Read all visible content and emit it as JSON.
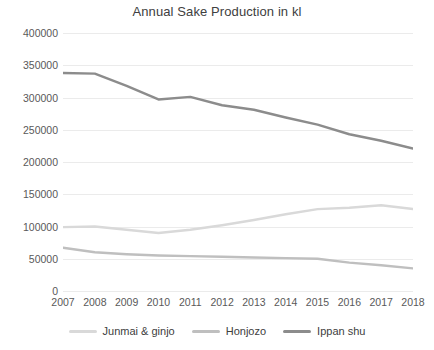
{
  "chart_data": {
    "type": "line",
    "title": "Annual Sake Production in kl",
    "xlabel": "",
    "ylabel": "",
    "categories": [
      "2007",
      "2008",
      "2009",
      "2010",
      "2011",
      "2012",
      "2013",
      "2014",
      "2015",
      "2016",
      "2017",
      "2018"
    ],
    "ylim": [
      0,
      400000
    ],
    "ytick_values": [
      0,
      50000,
      100000,
      150000,
      200000,
      250000,
      300000,
      350000,
      400000
    ],
    "ytick_labels": [
      "0",
      "50000",
      "100000",
      "150000",
      "200000",
      "250000",
      "300000",
      "350000",
      "400000"
    ],
    "grid": true,
    "legend_position": "bottom",
    "series": [
      {
        "name": "Junmai & ginjo",
        "color": "#d9d9d9",
        "values": [
          99000,
          100000,
          95000,
          90000,
          95000,
          102000,
          110000,
          119000,
          127000,
          129000,
          133000,
          127000
        ]
      },
      {
        "name": "Honjozo",
        "color": "#bfbfbf",
        "values": [
          67000,
          60000,
          57000,
          55000,
          54000,
          53000,
          52000,
          51000,
          50000,
          44000,
          40000,
          35000
        ]
      },
      {
        "name": "Ippan shu",
        "color": "#8c8c8c",
        "values": [
          338000,
          337000,
          318000,
          297000,
          301000,
          288000,
          281000,
          269000,
          258000,
          243000,
          233000,
          221000
        ]
      }
    ]
  },
  "colors": {
    "background": "#ffffff",
    "gridline": "#ebengray",
    "text": "#595959",
    "title": "#404040"
  }
}
